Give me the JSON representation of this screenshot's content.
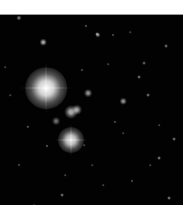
{
  "image": {
    "subject": "astronomical star field",
    "background_color": "#020202",
    "frame": {
      "x": 0,
      "y": 14,
      "width": 183,
      "height": 190
    }
  },
  "stars": [
    {
      "x": 46,
      "y": 73,
      "r": 16,
      "brightness": 1.0
    },
    {
      "x": 71,
      "y": 125,
      "r": 10,
      "brightness": 0.9
    },
    {
      "x": 71,
      "y": 97,
      "r": 5,
      "brightness": 0.7
    },
    {
      "x": 77,
      "y": 95,
      "r": 4,
      "brightness": 0.65
    },
    {
      "x": 56,
      "y": 106,
      "r": 3,
      "brightness": 0.45
    },
    {
      "x": 88,
      "y": 78,
      "r": 3,
      "brightness": 0.6
    },
    {
      "x": 123,
      "y": 86,
      "r": 2.5,
      "brightness": 0.6
    },
    {
      "x": 98,
      "y": 20,
      "r": 2,
      "brightness": 0.55
    },
    {
      "x": 19,
      "y": 3,
      "r": 2,
      "brightness": 0.5
    },
    {
      "x": 43,
      "y": 27,
      "r": 2.5,
      "brightness": 0.7
    },
    {
      "x": 97,
      "y": 19,
      "r": 1.5,
      "brightness": 0.5
    },
    {
      "x": 166,
      "y": 31,
      "r": 1.5,
      "brightness": 0.45
    },
    {
      "x": 144,
      "y": 48,
      "r": 1.5,
      "brightness": 0.4
    },
    {
      "x": 139,
      "y": 62,
      "r": 1.5,
      "brightness": 0.45
    },
    {
      "x": 86,
      "y": 11,
      "r": 1.2,
      "brightness": 0.4
    },
    {
      "x": 113,
      "y": 20,
      "r": 1.2,
      "brightness": 0.35
    },
    {
      "x": 174,
      "y": 124,
      "r": 1.5,
      "brightness": 0.45
    },
    {
      "x": 159,
      "y": 143,
      "r": 1.5,
      "brightness": 0.5
    },
    {
      "x": 148,
      "y": 80,
      "r": 1.5,
      "brightness": 0.45
    },
    {
      "x": 169,
      "y": 183,
      "r": 1.5,
      "brightness": 0.5
    },
    {
      "x": 62,
      "y": 180,
      "r": 1.5,
      "brightness": 0.45
    },
    {
      "x": 28,
      "y": 112,
      "r": 1.3,
      "brightness": 0.4
    },
    {
      "x": 47,
      "y": 131,
      "r": 1.2,
      "brightness": 0.4
    },
    {
      "x": 19,
      "y": 150,
      "r": 1.2,
      "brightness": 0.35
    },
    {
      "x": 115,
      "y": 107,
      "r": 1.2,
      "brightness": 0.35
    },
    {
      "x": 132,
      "y": 166,
      "r": 1.2,
      "brightness": 0.35
    },
    {
      "x": 82,
      "y": 55,
      "r": 1.2,
      "brightness": 0.35
    },
    {
      "x": 10,
      "y": 80,
      "r": 1.0,
      "brightness": 0.3
    },
    {
      "x": 103,
      "y": 170,
      "r": 1.0,
      "brightness": 0.3
    },
    {
      "x": 159,
      "y": 110,
      "r": 1.0,
      "brightness": 0.3
    },
    {
      "x": 108,
      "y": 49,
      "r": 1.0,
      "brightness": 0.3
    },
    {
      "x": 65,
      "y": 160,
      "r": 1.0,
      "brightness": 0.3
    },
    {
      "x": 34,
      "y": 190,
      "r": 1.0,
      "brightness": 0.3
    },
    {
      "x": 150,
      "y": 150,
      "r": 1.0,
      "brightness": 0.3
    },
    {
      "x": 84,
      "y": 130,
      "r": 1.0,
      "brightness": 0.3
    },
    {
      "x": 123,
      "y": 118,
      "r": 1.0,
      "brightness": 0.28
    },
    {
      "x": 92,
      "y": 150,
      "r": 1.0,
      "brightness": 0.28
    },
    {
      "x": 5,
      "y": 52,
      "r": 1.0,
      "brightness": 0.28
    },
    {
      "x": 130,
      "y": 17,
      "r": 1.0,
      "brightness": 0.28
    }
  ]
}
